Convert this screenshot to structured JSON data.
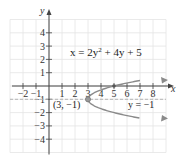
{
  "chart_data": {
    "type": "line",
    "title": "",
    "xlabel": "x",
    "ylabel": "y",
    "xlim": [
      -3,
      9
    ],
    "ylim": [
      -5,
      5
    ],
    "grid": true,
    "x_ticks": [
      -2,
      -1,
      1,
      2,
      3,
      4,
      5,
      6,
      7,
      8
    ],
    "x_tick_labels": [
      "−2",
      "−1",
      "1",
      "2",
      "3",
      "4",
      "5",
      "6",
      "7",
      "8"
    ],
    "y_ticks": [
      4,
      3,
      2,
      1,
      -1,
      -2,
      -3,
      -4
    ],
    "y_tick_labels": [
      "4",
      "3",
      "2",
      "1",
      "−1",
      "−2",
      "−3",
      "−4"
    ],
    "series": [
      {
        "name": "x = 2y² + 4y + 5",
        "equation": "x = 2y^2 + 4y + 5",
        "kind": "parabola opening right",
        "points": [
          {
            "x": 9,
            "y": 0.414
          },
          {
            "x": 7,
            "y": 0
          },
          {
            "x": 5,
            "y": 0
          },
          {
            "x": 3.5,
            "y": -0.5
          },
          {
            "x": 3,
            "y": -1
          },
          {
            "x": 3.5,
            "y": -1.5
          },
          {
            "x": 5,
            "y": -2
          },
          {
            "x": 7,
            "y": -2.5
          },
          {
            "x": 9,
            "y": -2.414
          }
        ],
        "color": "#888888"
      },
      {
        "name": "y = −1",
        "kind": "axis of symmetry (dashed)",
        "points": [
          {
            "x": -3,
            "y": -1
          },
          {
            "x": 9,
            "y": -1
          }
        ],
        "color": "#aaaaaa"
      }
    ],
    "annotations": [
      {
        "text": "x = 2y² + 4y + 5",
        "at": [
          5,
          2
        ]
      },
      {
        "text": "(3, −1)",
        "at": [
          3,
          -1
        ],
        "label": "vertex"
      },
      {
        "text": "y = −1",
        "at": [
          7,
          -1.5
        ]
      }
    ],
    "vertex": {
      "x": 3,
      "y": -1,
      "label": "(3, −1)"
    }
  },
  "labels": {
    "x_axis": "x",
    "y_axis": "y",
    "equation_prefix": "x = 2y",
    "equation_exp": "2",
    "equation_suffix": " + 4y + 5",
    "vertex_label": "(3, −1)",
    "symmetry_label": "y = −1"
  },
  "colors": {
    "grid": "#e4e4e4",
    "axis": "#444444",
    "curve": "#8a8a8a",
    "dashed": "#b0b0b0",
    "text": "#222222"
  }
}
